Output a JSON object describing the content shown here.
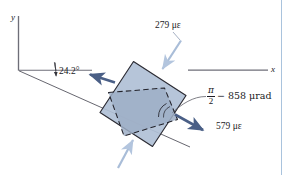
{
  "figure": {
    "axes": {
      "y_label": "y",
      "x_label": "x"
    },
    "angle": {
      "value_label": "24.2°"
    },
    "annotations": {
      "normal_strain_top": "279 με",
      "normal_strain_right": "579 με",
      "shear_angle_numerator": "π",
      "shear_angle_denominator": "2",
      "shear_angle_rest": "− 858 μrad"
    },
    "colors": {
      "outer_square_fill": "#b0c0d6",
      "inner_square_fill": "#9daec6",
      "outline": "#2b2b33",
      "arrow_dark": "#4a5f86",
      "arrow_light": "#a9bdd8",
      "margin_rule": "#a9c3dd"
    }
  }
}
